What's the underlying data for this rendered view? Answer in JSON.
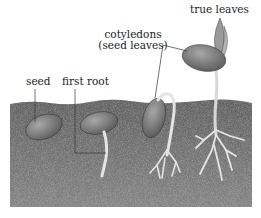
{
  "diagram": {
    "labels": {
      "seed": "seed",
      "first_root": "first root",
      "cotyledons_line1": "cotyledons",
      "cotyledons_line2": "(seed leaves)",
      "true_leaves": "true leaves"
    },
    "stages": [
      {
        "name": "seed",
        "description": "Bean seed buried in soil"
      },
      {
        "name": "first root",
        "description": "Seed with first root emerging downward"
      },
      {
        "name": "cotyledons emerging",
        "description": "Hooked stem pushing cotyledons up, branching roots"
      },
      {
        "name": "seedling",
        "description": "Cotyledons above soil with true leaves, branched root system"
      }
    ],
    "colors": {
      "soil": "#6e6e6e",
      "soil_dark": "#4a4a4a",
      "seed": "#8a8a8a",
      "root": "#e6e6e6",
      "leader_line": "#333333",
      "text": "#222222"
    }
  }
}
